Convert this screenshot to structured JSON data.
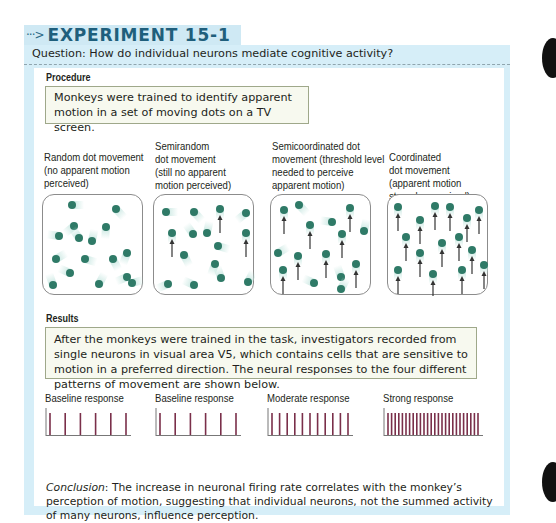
{
  "header": {
    "arrow": "···>",
    "title": "EXPERIMENT 15-1"
  },
  "question": "Question: How do individual neurons mediate cognitive activity?",
  "procedure": {
    "label": "Procedure",
    "text": "Monkeys were trained to identify apparent motion in a set of moving dots on a TV screen."
  },
  "conditions": [
    {
      "lines": [
        "Random dot movement",
        "(no apparent motion",
        "perceived)"
      ],
      "dots": [
        [
          29,
          10,
          0
        ],
        [
          73,
          14,
          0
        ],
        [
          63,
          32,
          0
        ],
        [
          31,
          31,
          0
        ],
        [
          16,
          41,
          0
        ],
        [
          36,
          43,
          0
        ],
        [
          49,
          46,
          0
        ],
        [
          13,
          64,
          0
        ],
        [
          42,
          64,
          0
        ],
        [
          70,
          64,
          0
        ],
        [
          84,
          58,
          0
        ],
        [
          84,
          82,
          0
        ],
        [
          27,
          78,
          0
        ],
        [
          10,
          90,
          0
        ],
        [
          56,
          89,
          0
        ],
        [
          89,
          88,
          0
        ]
      ]
    },
    {
      "lines": [
        "Semirandom",
        "dot movement",
        "(still no apparent",
        "motion perceived)"
      ],
      "dots": [
        [
          12,
          17,
          0
        ],
        [
          40,
          17,
          0
        ],
        [
          66,
          14,
          1
        ],
        [
          92,
          18,
          0
        ],
        [
          18,
          38,
          1
        ],
        [
          39,
          39,
          0
        ],
        [
          53,
          38,
          0
        ],
        [
          92,
          38,
          1
        ],
        [
          64,
          51,
          0
        ],
        [
          30,
          60,
          0
        ],
        [
          61,
          69,
          0
        ],
        [
          14,
          89,
          0
        ],
        [
          40,
          90,
          0
        ],
        [
          67,
          83,
          0
        ],
        [
          94,
          87,
          0
        ]
      ]
    },
    {
      "lines": [
        "Semicoordinated dot",
        "movement (threshold level",
        "needed to perceive",
        "apparent motion)"
      ],
      "dots": [
        [
          13,
          15,
          1
        ],
        [
          28,
          10,
          0
        ],
        [
          79,
          13,
          1
        ],
        [
          39,
          30,
          1
        ],
        [
          61,
          27,
          0
        ],
        [
          71,
          39,
          1
        ],
        [
          93,
          36,
          0
        ],
        [
          7,
          58,
          0
        ],
        [
          27,
          61,
          1
        ],
        [
          55,
          59,
          1
        ],
        [
          12,
          75,
          1
        ],
        [
          85,
          69,
          1
        ],
        [
          43,
          88,
          0
        ],
        [
          70,
          82,
          0
        ],
        [
          70,
          94,
          0
        ]
      ]
    },
    {
      "lines": [
        "Coordinated",
        "dot movement",
        "(apparent motion",
        "strongly perceived)"
      ],
      "dots": [
        [
          10,
          12,
          1
        ],
        [
          47,
          11,
          1
        ],
        [
          62,
          12,
          1
        ],
        [
          91,
          15,
          1
        ],
        [
          32,
          25,
          1
        ],
        [
          79,
          23,
          1
        ],
        [
          18,
          42,
          1
        ],
        [
          71,
          42,
          1
        ],
        [
          54,
          48,
          1
        ],
        [
          32,
          58,
          1
        ],
        [
          84,
          55,
          1
        ],
        [
          10,
          75,
          1
        ],
        [
          45,
          79,
          1
        ],
        [
          74,
          75,
          1
        ],
        [
          96,
          70,
          1
        ]
      ]
    }
  ],
  "results": {
    "label": "Results",
    "text": "After the monkeys were trained in the task, investigators recorded from single neurons in visual area V5, which contains cells that are sensitive to motion in a preferred direction. The neural responses to the four different patterns of movement are shown below."
  },
  "responses": [
    {
      "label": "Baseline response",
      "spikes": 6
    },
    {
      "label": "Baseline response",
      "spikes": 6
    },
    {
      "label": "Moderate response",
      "spikes": 11
    },
    {
      "label": "Strong response",
      "spikes": 26
    }
  ],
  "conclusion": {
    "lead": "Conclusion",
    "text": ": The increase in neuronal firing rate correlates with the monkey’s perception of motion, suggesting that individual neurons, not the summed activity of many neurons, influence perception."
  },
  "colors": {
    "frame_bg": "#d6eef8",
    "title": "#1f5f7c",
    "dot": "#2f7a67",
    "trail": "#bfe3dc",
    "spike": "#7a2f4a",
    "box_border": "#9fa88a"
  }
}
